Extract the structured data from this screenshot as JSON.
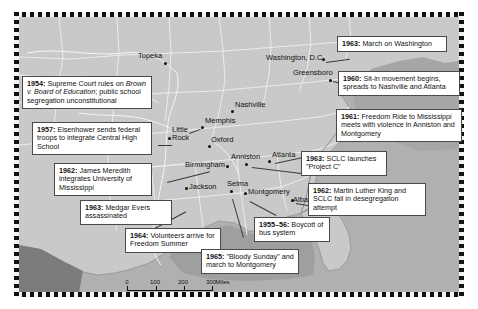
{
  "figure": {
    "kind": "historical-reference-map",
    "background_color": "#c5c5c5",
    "land_color": "#c9c9c9",
    "water_color": "#9a9a9a",
    "border_style": "black-and-white dashed neatline"
  },
  "callouts": [
    {
      "id": "brown-1954",
      "year": "1954:",
      "text_before_italic": " Supreme Court rules on ",
      "italic": "Brown v. Board of Education",
      "text_after_italic": "; public school segregation unconstitutional"
    },
    {
      "id": "little-rock-1957",
      "year": "1957:",
      "text": " Eisenhower sends federal troops to integrate Central High School"
    },
    {
      "id": "meredith-1962",
      "year": "1962:",
      "text": " James Meredith integrates University of Mississippi"
    },
    {
      "id": "evers-1963",
      "year": "1963:",
      "text": " Medgar Evers assassinated"
    },
    {
      "id": "freedom-summer-1964",
      "year": "1964:",
      "text": " Volunteers arrive for Freedom Summer"
    },
    {
      "id": "bloody-sunday-1965",
      "year": "1965:",
      "text": " \"Bloody Sunday\" and march to Montgomery"
    },
    {
      "id": "bus-boycott-1955",
      "year": "1955–56:",
      "text": " Boycott of bus system"
    },
    {
      "id": "albany-1962",
      "year": "1962:",
      "text": " Martin Luther King and SCLC fail in desegregation attempt"
    },
    {
      "id": "project-c-1963",
      "year": "1963:",
      "text": " SCLC launches \"Project C\""
    },
    {
      "id": "freedom-ride-1961",
      "year": "1961:",
      "text": " Freedom Ride to Mississippi meets with violence in Anniston and Montgomery"
    },
    {
      "id": "sit-in-1960",
      "year": "1960:",
      "text": " Sit-in movement begins, spreads to Nashville and Atlanta"
    },
    {
      "id": "march-washington-1963",
      "year": "1963:",
      "text": " March on Washington"
    }
  ],
  "cities": [
    {
      "name": "Topeka"
    },
    {
      "name": "Little Rock"
    },
    {
      "name": "Memphis"
    },
    {
      "name": "Oxford"
    },
    {
      "name": "Birmingham"
    },
    {
      "name": "Anniston"
    },
    {
      "name": "Nashville"
    },
    {
      "name": "Atlanta"
    },
    {
      "name": "Jackson"
    },
    {
      "name": "Selma"
    },
    {
      "name": "Montgomery"
    },
    {
      "name": "Albany"
    },
    {
      "name": "Greensboro"
    },
    {
      "name": "Washington, D.C."
    }
  ],
  "scale_bar": {
    "miles": {
      "labels": [
        "0",
        "100",
        "200",
        "300"
      ],
      "unit": "Miles"
    },
    "kilometers": {
      "labels": [
        "0",
        "100",
        "200",
        "300"
      ],
      "unit": "Kilometers"
    }
  }
}
